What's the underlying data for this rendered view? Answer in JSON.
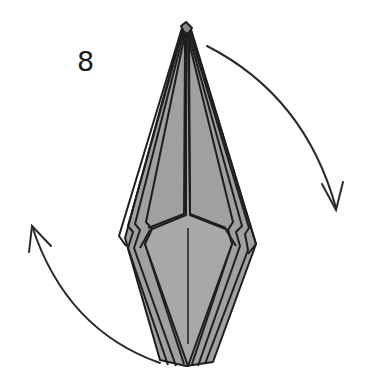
{
  "diagram": {
    "type": "origami-folding-step",
    "step_number": "8",
    "colors": {
      "paper_fill": "#9a9a9a",
      "paper_light": "#a8a8a8",
      "line": "#1e1e1e",
      "background": "#ffffff"
    },
    "elements": [
      {
        "name": "folded-model",
        "description": "Elongated diamond-shaped multi-layer folded paper, point up and point down"
      },
      {
        "name": "arrow-top-right",
        "description": "Curved arrow from top right of model sweeping down clockwise"
      },
      {
        "name": "arrow-bottom-left",
        "description": "Curved arrow from bottom left of model sweeping up clockwise"
      }
    ]
  }
}
